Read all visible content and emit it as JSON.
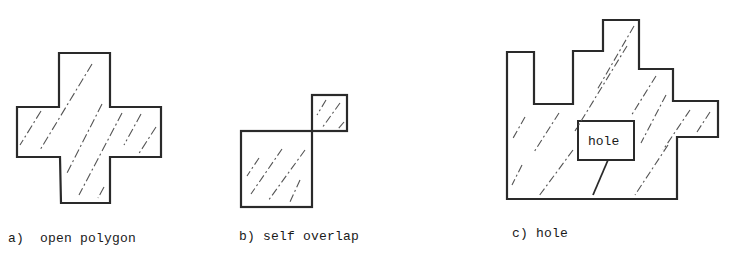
{
  "figure": {
    "panels": [
      {
        "id": "a",
        "caption": "a)  open polygon",
        "shape": "cross"
      },
      {
        "id": "b",
        "caption": "b) self overlap",
        "shape": "two squares touching at a corner"
      },
      {
        "id": "c",
        "caption": "c) hole",
        "shape": "stepped polygon with interior hole",
        "hole_label": "hole"
      }
    ]
  },
  "colors": {
    "stroke": "#2a2a2a",
    "hatch": "#555555",
    "background": "#ffffff"
  }
}
